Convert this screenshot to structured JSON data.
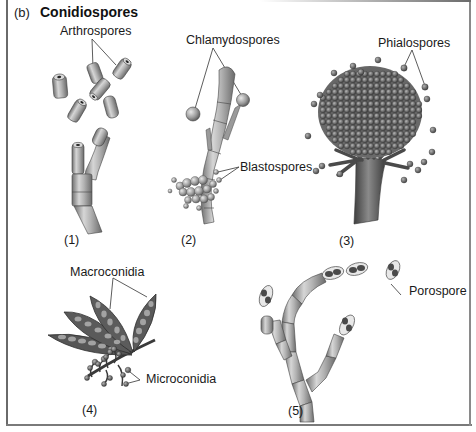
{
  "figure": {
    "panel_tag": "(b)",
    "title": "Conidiospores",
    "labels": {
      "arthrospores": "Arthrospores",
      "chlamydospores": "Chlamydospores",
      "blastospores": "Blastospores",
      "phialospores": "Phialospores",
      "macroconidia": "Macroconidia",
      "microconidia": "Microconidia",
      "porospore": "Porospore"
    },
    "subpanels": [
      {
        "number": "(1)",
        "depicts": "Arthrospores"
      },
      {
        "number": "(2)",
        "depicts": "Chlamydospores and Blastospores"
      },
      {
        "number": "(3)",
        "depicts": "Phialospores"
      },
      {
        "number": "(4)",
        "depicts": "Macroconidia and Microconidia"
      },
      {
        "number": "(5)",
        "depicts": "Porospore"
      }
    ],
    "colors": {
      "frame": "#6a6a6a",
      "hypha_fill": "#a8a8a8",
      "spore_dark": "#5e5e5e",
      "text": "#1a1a1a"
    }
  }
}
